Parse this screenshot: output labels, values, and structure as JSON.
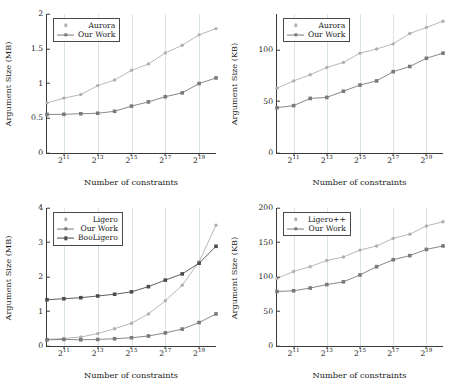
{
  "figure": {
    "layout": "2x2 grid of line charts",
    "colors": {
      "light_gray_series": "#b0b0b0",
      "mid_gray_series": "#7a7a7a",
      "dark_gray_series": "#4d4d4d",
      "axis": "#3a3a3a",
      "grid": "#d9e3ea",
      "background": "#ffffff"
    }
  },
  "chart_data": [
    {
      "id": "top-left",
      "type": "line",
      "title": "",
      "xlabel": "Number of constraints",
      "ylabel": "Argument Size (MB)",
      "x": [
        "2^10",
        "2^11",
        "2^12",
        "2^13",
        "2^14",
        "2^15",
        "2^16",
        "2^17",
        "2^18",
        "2^19",
        "2^20"
      ],
      "xticks": [
        {
          "base": "2",
          "exp": "11"
        },
        {
          "base": "2",
          "exp": "13"
        },
        {
          "base": "2",
          "exp": "15"
        },
        {
          "base": "2",
          "exp": "17"
        },
        {
          "base": "2",
          "exp": "19"
        }
      ],
      "xtick_positions": [
        0.1,
        0.3,
        0.5,
        0.7,
        0.9
      ],
      "yticks": [
        "0",
        "0.5",
        "1",
        "1.5",
        "2"
      ],
      "ylim": [
        0,
        2
      ],
      "grid": "vertical",
      "legend_position": "top-left inside",
      "series": [
        {
          "name": "Aurora",
          "color": "#b0b0b0",
          "marker": "circle",
          "values": [
            0.72,
            0.79,
            0.84,
            0.97,
            1.05,
            1.19,
            1.28,
            1.44,
            1.55,
            1.7,
            1.79
          ]
        },
        {
          "name": "Our Work",
          "color": "#7a7a7a",
          "marker": "square",
          "values": [
            0.555,
            0.557,
            0.565,
            0.572,
            0.6,
            0.675,
            0.735,
            0.81,
            0.865,
            1.0,
            1.08
          ]
        }
      ]
    },
    {
      "id": "top-right",
      "type": "line",
      "title": "",
      "xlabel": "Number of constraints",
      "ylabel": "Argument Size (KB)",
      "x": [
        "2^10",
        "2^11",
        "2^12",
        "2^13",
        "2^14",
        "2^15",
        "2^16",
        "2^17",
        "2^18",
        "2^19",
        "2^20"
      ],
      "xticks": [
        {
          "base": "2",
          "exp": "11"
        },
        {
          "base": "2",
          "exp": "13"
        },
        {
          "base": "2",
          "exp": "15"
        },
        {
          "base": "2",
          "exp": "17"
        },
        {
          "base": "2",
          "exp": "19"
        }
      ],
      "xtick_positions": [
        0.1,
        0.3,
        0.5,
        0.7,
        0.9
      ],
      "yticks": [
        "0",
        "50",
        "100"
      ],
      "ylim": [
        0,
        135
      ],
      "grid": "vertical",
      "legend_position": "top-left inside",
      "series": [
        {
          "name": "Aurora",
          "color": "#b0b0b0",
          "marker": "circle",
          "values": [
            63,
            70,
            76,
            83,
            88,
            97,
            101,
            106,
            116,
            122,
            128
          ]
        },
        {
          "name": "Our Work",
          "color": "#7a7a7a",
          "marker": "square",
          "values": [
            44,
            46,
            53,
            54,
            60,
            66,
            70,
            79,
            84,
            92,
            97
          ]
        }
      ]
    },
    {
      "id": "bottom-left",
      "type": "line",
      "title": "",
      "xlabel": "Number of constraints",
      "ylabel": "Argument Size (MB)",
      "x": [
        "2^10",
        "2^11",
        "2^12",
        "2^13",
        "2^14",
        "2^15",
        "2^16",
        "2^17",
        "2^18",
        "2^19",
        "2^20"
      ],
      "xticks": [
        {
          "base": "2",
          "exp": "11"
        },
        {
          "base": "2",
          "exp": "13"
        },
        {
          "base": "2",
          "exp": "15"
        },
        {
          "base": "2",
          "exp": "17"
        },
        {
          "base": "2",
          "exp": "19"
        }
      ],
      "xtick_positions": [
        0.1,
        0.3,
        0.5,
        0.7,
        0.9
      ],
      "yticks": [
        "0",
        "1",
        "2",
        "3",
        "4"
      ],
      "ylim": [
        0,
        4
      ],
      "grid": "vertical",
      "legend_position": "top-left inside",
      "series": [
        {
          "name": "Ligero",
          "color": "#b0b0b0",
          "marker": "circle",
          "values": [
            0.19,
            0.22,
            0.26,
            0.36,
            0.5,
            0.66,
            0.93,
            1.31,
            1.76,
            2.44,
            3.5
          ]
        },
        {
          "name": "Our Work",
          "color": "#7a7a7a",
          "marker": "square",
          "values": [
            0.18,
            0.19,
            0.18,
            0.19,
            0.21,
            0.24,
            0.29,
            0.38,
            0.49,
            0.68,
            0.93
          ]
        },
        {
          "name": "BooLigero",
          "color": "#4d4d4d",
          "marker": "square",
          "values": [
            1.34,
            1.37,
            1.4,
            1.45,
            1.5,
            1.57,
            1.72,
            1.91,
            2.09,
            2.4,
            2.89
          ]
        }
      ]
    },
    {
      "id": "bottom-right",
      "type": "line",
      "title": "",
      "xlabel": "Number of constraints",
      "ylabel": "Argument Size (KB)",
      "x": [
        "2^10",
        "2^11",
        "2^12",
        "2^13",
        "2^14",
        "2^15",
        "2^16",
        "2^17",
        "2^18",
        "2^19",
        "2^20"
      ],
      "xticks": [
        {
          "base": "2",
          "exp": "11"
        },
        {
          "base": "2",
          "exp": "13"
        },
        {
          "base": "2",
          "exp": "15"
        },
        {
          "base": "2",
          "exp": "17"
        },
        {
          "base": "2",
          "exp": "19"
        }
      ],
      "xtick_positions": [
        0.1,
        0.3,
        0.5,
        0.7,
        0.9
      ],
      "yticks": [
        "0",
        "50",
        "100",
        "150",
        "200"
      ],
      "ylim": [
        0,
        200
      ],
      "grid": "vertical",
      "legend_position": "top-left inside",
      "series": [
        {
          "name": "Ligero++",
          "color": "#b0b0b0",
          "marker": "circle",
          "values": [
            98,
            108,
            115,
            124,
            129,
            139,
            145,
            156,
            162,
            174,
            180
          ]
        },
        {
          "name": "Our Work",
          "color": "#7a7a7a",
          "marker": "square",
          "values": [
            79,
            80,
            84,
            89,
            93,
            103,
            115,
            125,
            131,
            140,
            145
          ]
        }
      ]
    }
  ]
}
